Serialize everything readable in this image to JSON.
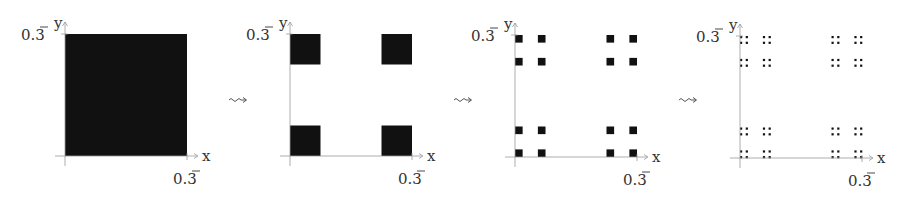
{
  "diagram": {
    "transition_symbol": "⇝",
    "panels": [
      {
        "iteration": 0,
        "x_axis_label": "x",
        "y_axis_label": "y",
        "x_tick_label": "0.3̄",
        "y_tick_label": "0.3̄",
        "squares_per_axis": 1
      },
      {
        "iteration": 1,
        "x_axis_label": "x",
        "y_axis_label": "y",
        "x_tick_label": "0.3̄",
        "y_tick_label": "0.3̄",
        "squares_per_axis": 2
      },
      {
        "iteration": 2,
        "x_axis_label": "x",
        "y_axis_label": "y",
        "x_tick_label": "0.3̄",
        "y_tick_label": "0.3̄",
        "squares_per_axis": 4
      },
      {
        "iteration": 3,
        "x_axis_label": "x",
        "y_axis_label": "y",
        "x_tick_label": "0.3̄",
        "y_tick_label": "0.3̄",
        "squares_per_axis": 8
      }
    ]
  },
  "colors": {
    "fill": "#111111",
    "axis": "#999999",
    "text": "#333333"
  }
}
